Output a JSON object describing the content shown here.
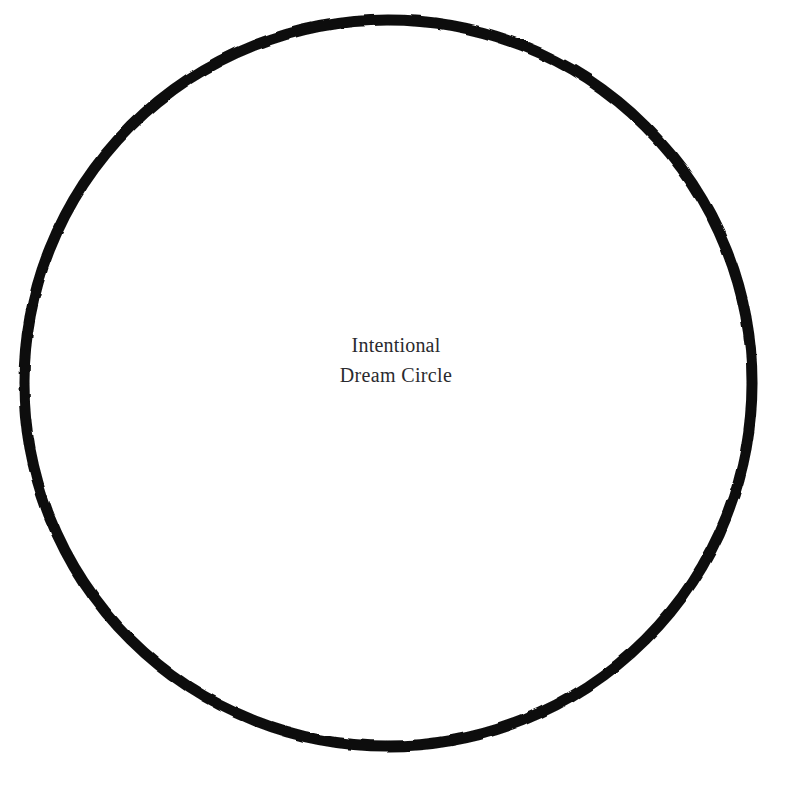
{
  "canvas": {
    "width": 792,
    "height": 788,
    "background_color": "#ffffff"
  },
  "figure": {
    "shape": "circle",
    "stroke_color": "#0d0d0d",
    "stroke_width_px": 11,
    "fill": "none",
    "center_x": 388,
    "center_y": 383,
    "radius_x": 364,
    "radius_y": 363,
    "edge_quality": "hand-inked, slightly irregular"
  },
  "label": {
    "line1": "Intentional",
    "line2": "Dream Circle",
    "full_text": "Intentional Dream Circle",
    "color": "#2a2a2e",
    "font_size_px": 20,
    "line_height_px": 30,
    "align": "center",
    "center_x": 380,
    "top_y": 330
  }
}
